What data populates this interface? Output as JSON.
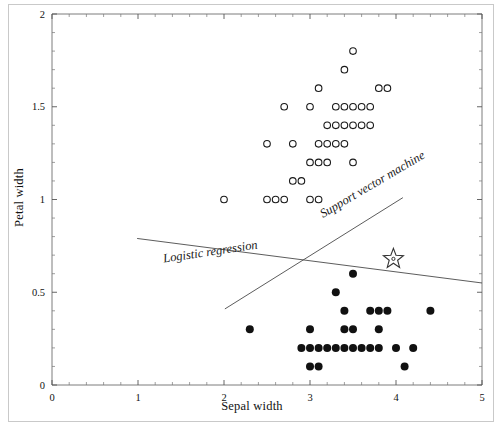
{
  "chart_data": {
    "type": "scatter",
    "title": "",
    "xlabel": "Sepal width",
    "ylabel": "Petal width",
    "xlim": [
      0,
      5
    ],
    "ylim": [
      0,
      2
    ],
    "xticks": [
      "0",
      "1",
      "2",
      "3",
      "4",
      "5"
    ],
    "yticks": [
      "0",
      "0.5",
      "1",
      "1.5",
      "2"
    ],
    "xtick_values": [
      0,
      1,
      2,
      3,
      4,
      5
    ],
    "ytick_values": [
      0,
      0.5,
      1,
      1.5,
      2
    ],
    "minor_tick_count": 5,
    "grid": false,
    "legend": "none",
    "series": [
      {
        "name": "open-circles",
        "marker": "open-circle",
        "color": "#1a1a1a",
        "points": [
          [
            3.5,
            1.8
          ],
          [
            3.4,
            1.7
          ],
          [
            3.1,
            1.6
          ],
          [
            3.8,
            1.6
          ],
          [
            3.9,
            1.6
          ],
          [
            2.7,
            1.5
          ],
          [
            3.0,
            1.5
          ],
          [
            3.3,
            1.5
          ],
          [
            3.4,
            1.5
          ],
          [
            3.5,
            1.5
          ],
          [
            3.6,
            1.5
          ],
          [
            3.7,
            1.5
          ],
          [
            3.2,
            1.4
          ],
          [
            3.3,
            1.4
          ],
          [
            3.4,
            1.4
          ],
          [
            3.5,
            1.4
          ],
          [
            3.6,
            1.4
          ],
          [
            3.7,
            1.4
          ],
          [
            2.5,
            1.3
          ],
          [
            2.8,
            1.3
          ],
          [
            3.1,
            1.3
          ],
          [
            3.2,
            1.3
          ],
          [
            3.3,
            1.3
          ],
          [
            3.4,
            1.3
          ],
          [
            3.0,
            1.2
          ],
          [
            3.1,
            1.2
          ],
          [
            3.2,
            1.2
          ],
          [
            3.5,
            1.2
          ],
          [
            2.8,
            1.1
          ],
          [
            2.9,
            1.1
          ],
          [
            2.0,
            1.0
          ],
          [
            2.5,
            1.0
          ],
          [
            2.6,
            1.0
          ],
          [
            2.7,
            1.0
          ],
          [
            3.0,
            1.0
          ],
          [
            3.1,
            1.0
          ]
        ]
      },
      {
        "name": "filled-circles",
        "marker": "filled-circle",
        "color": "#111111",
        "points": [
          [
            3.5,
            0.6
          ],
          [
            3.3,
            0.5
          ],
          [
            3.4,
            0.4
          ],
          [
            3.7,
            0.4
          ],
          [
            3.8,
            0.4
          ],
          [
            3.9,
            0.4
          ],
          [
            4.4,
            0.4
          ],
          [
            2.3,
            0.3
          ],
          [
            3.0,
            0.3
          ],
          [
            3.4,
            0.3
          ],
          [
            3.5,
            0.3
          ],
          [
            3.8,
            0.3
          ],
          [
            2.9,
            0.2
          ],
          [
            3.0,
            0.2
          ],
          [
            3.1,
            0.2
          ],
          [
            3.2,
            0.2
          ],
          [
            3.3,
            0.2
          ],
          [
            3.4,
            0.2
          ],
          [
            3.5,
            0.2
          ],
          [
            3.6,
            0.2
          ],
          [
            3.7,
            0.2
          ],
          [
            3.8,
            0.2
          ],
          [
            4.0,
            0.2
          ],
          [
            4.2,
            0.2
          ],
          [
            3.0,
            0.1
          ],
          [
            3.1,
            0.1
          ],
          [
            4.1,
            0.1
          ]
        ]
      },
      {
        "name": "query-point",
        "marker": "star",
        "color": "#333333",
        "points": [
          [
            3.97,
            0.68
          ]
        ]
      }
    ],
    "lines": [
      {
        "name": "Logistic regression",
        "label": "Logistic regression",
        "x0": 0.99,
        "y0": 0.79,
        "x1": 5.0,
        "y1": 0.55,
        "label_x": 1.3,
        "label_y": 0.66,
        "label_rotation": -8.5
      },
      {
        "name": "Support vector machine",
        "label": "Support vector machine",
        "x0": 2.01,
        "y0": 0.41,
        "x1": 4.08,
        "y1": 1.01,
        "label_x": 3.15,
        "label_y": 0.9,
        "label_rotation": -30.5
      }
    ]
  }
}
